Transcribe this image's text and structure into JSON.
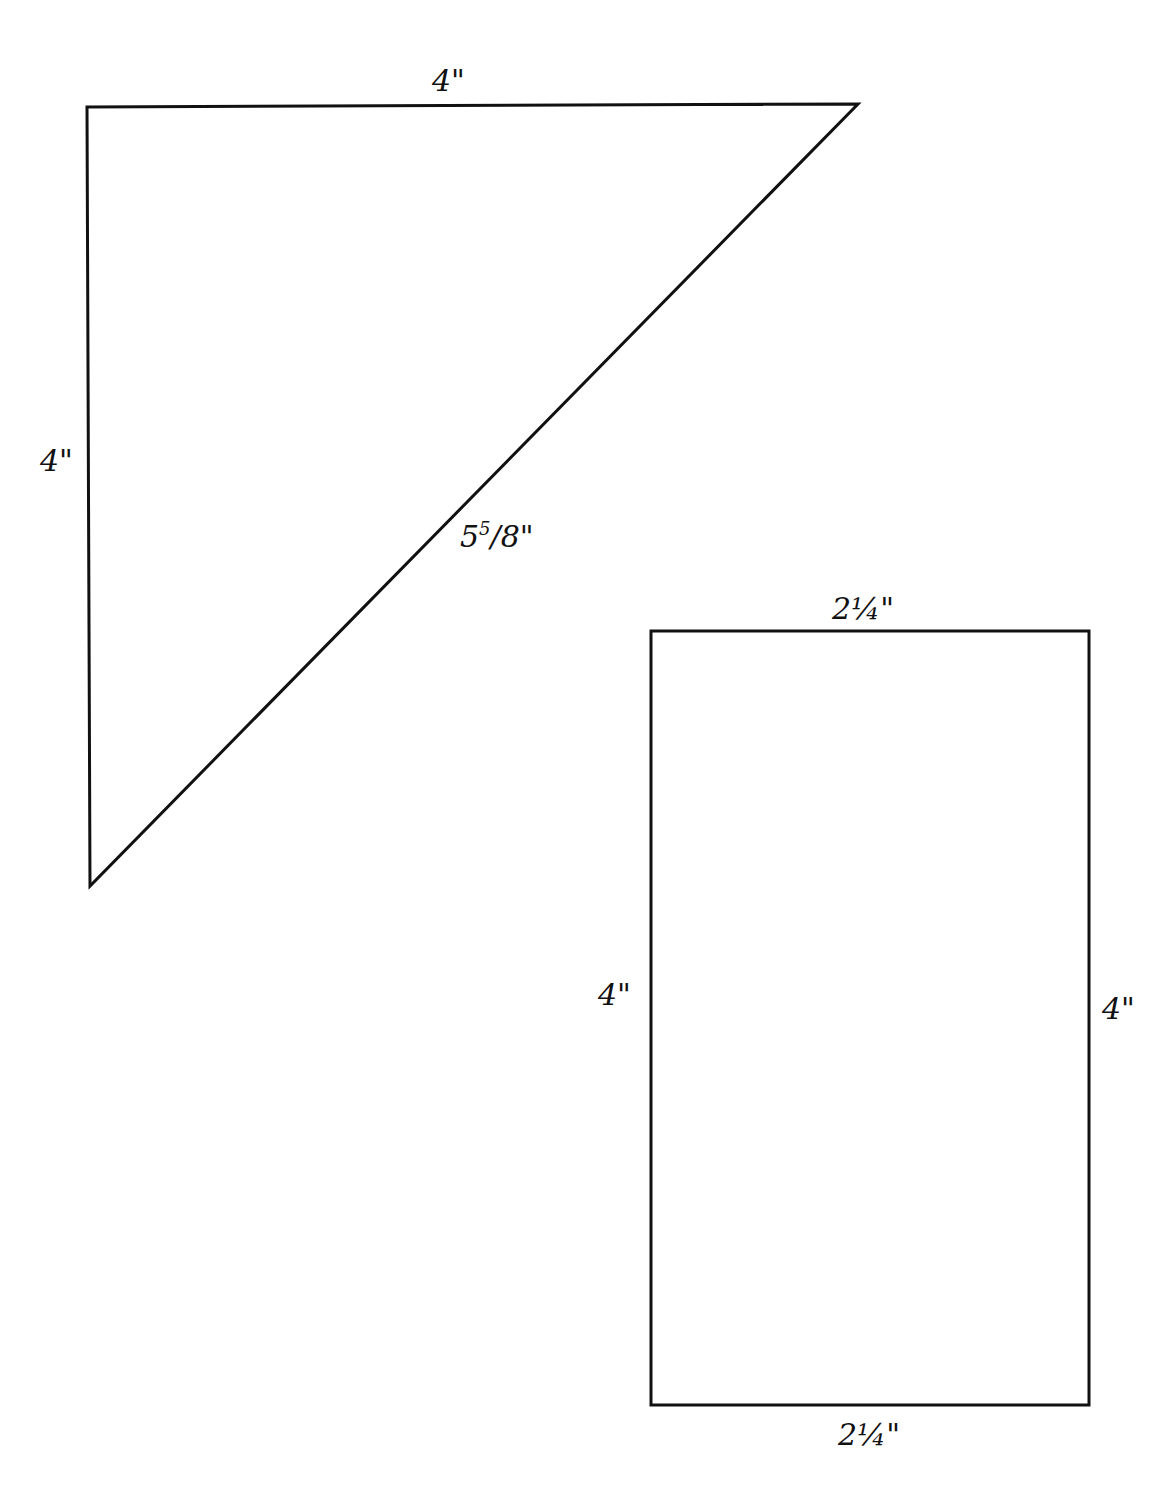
{
  "diagram": {
    "type": "pattern-template",
    "shapes": [
      {
        "id": "triangle",
        "kind": "right-triangle",
        "vertices": [
          [
            87,
            107
          ],
          [
            858,
            104
          ],
          [
            90,
            886
          ]
        ],
        "labels": {
          "top": "4\"",
          "left": "4\"",
          "hypotenuse_whole": "5",
          "hypotenuse_frac_num": "5",
          "hypotenuse_frac_den": "/8\"",
          "hypotenuse_full": "5 5/8\""
        }
      },
      {
        "id": "rectangle",
        "kind": "rectangle",
        "x": 651,
        "y": 631,
        "width": 438,
        "height": 774,
        "labels": {
          "top": "2¼\"",
          "bottom": "2¼\"",
          "left": "4\"",
          "right": "4\""
        }
      }
    ],
    "stroke_color": "#111111",
    "background": "#ffffff"
  }
}
